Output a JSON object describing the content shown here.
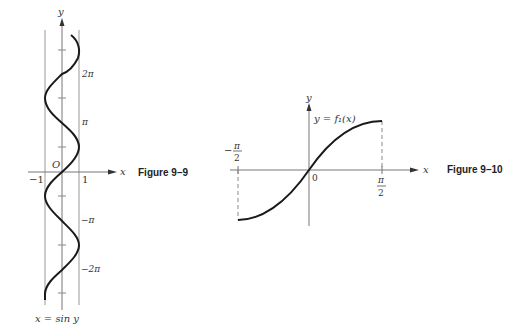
{
  "figure_9_9": {
    "caption": "Figure 9–9",
    "axis_x_label": "x",
    "axis_y_label": "y",
    "origin_label": "O",
    "x_tick_neg": "−1",
    "x_tick_pos": "1",
    "y_labels": [
      "2π",
      "π",
      "−π",
      "−2π"
    ],
    "curve_label": "x = sin y"
  },
  "figure_9_10": {
    "caption": "Figure 9–10",
    "axis_x_label": "x",
    "axis_y_label": "y",
    "origin_label": "0",
    "curve_label": "y = f₁(x)",
    "left_tick_sign": "−",
    "left_tick_num": "π",
    "left_tick_den": "2",
    "right_tick_num": "π",
    "right_tick_den": "2"
  },
  "colors": {
    "ink": "#1a1a1a",
    "guide": "#999999",
    "axis": "#555555"
  }
}
